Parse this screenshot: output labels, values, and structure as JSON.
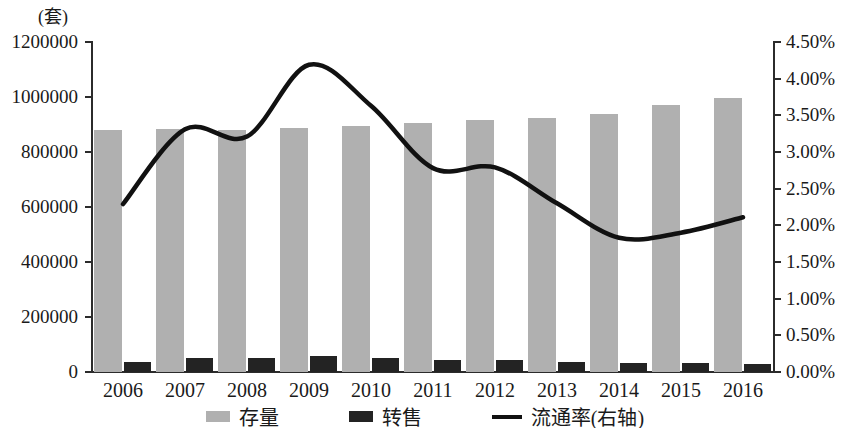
{
  "chart_data": {
    "type": "bar",
    "title": "",
    "subtitle": "",
    "unit_caption": "(套)",
    "xlabel": "",
    "ylabel": "(套)",
    "y2label": "",
    "grid": false,
    "legend_position": "bottom",
    "categories": [
      "2006",
      "2007",
      "2008",
      "2009",
      "2010",
      "2011",
      "2012",
      "2013",
      "2014",
      "2015",
      "2016"
    ],
    "ylim": [
      0,
      1200000
    ],
    "yticks": [
      0,
      200000,
      400000,
      600000,
      800000,
      1000000,
      1200000
    ],
    "ytick_labels": [
      "0",
      "200000",
      "400000",
      "600000",
      "800000",
      "1000000",
      "1200000"
    ],
    "y2lim": [
      0,
      4.5
    ],
    "y2ticks": [
      0,
      0.5,
      1.0,
      1.5,
      2.0,
      2.5,
      3.0,
      3.5,
      4.0,
      4.5
    ],
    "y2tick_labels": [
      "0.00%",
      "0.50%",
      "1.00%",
      "1.50%",
      "2.00%",
      "2.50%",
      "3.00%",
      "3.50%",
      "4.00%",
      "4.50%"
    ],
    "series": [
      {
        "name": "存量",
        "type": "bar",
        "axis": "left",
        "color": "#b0b0b0",
        "values": [
          880000,
          885000,
          880000,
          888000,
          895000,
          905000,
          915000,
          925000,
          940000,
          970000,
          995000
        ]
      },
      {
        "name": "转售",
        "type": "bar",
        "axis": "left",
        "color": "#232323",
        "values": [
          36000,
          50000,
          52000,
          58000,
          50000,
          42000,
          42000,
          36000,
          32000,
          34000,
          30000
        ]
      },
      {
        "name": "流通率(右轴)",
        "type": "line",
        "axis": "right",
        "color": "#111111",
        "values": [
          2.29,
          3.31,
          3.21,
          4.19,
          3.63,
          2.78,
          2.79,
          2.3,
          1.83,
          1.9,
          2.11
        ]
      }
    ]
  },
  "legend": {
    "items": [
      {
        "label": "存量",
        "marker": "bar-gray",
        "color": "#b0b0b0"
      },
      {
        "label": "转售",
        "marker": "bar-dark",
        "color": "#232323"
      },
      {
        "label": "流通率(右轴)",
        "marker": "line-black",
        "color": "#111111"
      }
    ]
  }
}
